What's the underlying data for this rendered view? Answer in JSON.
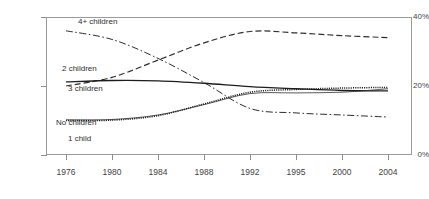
{
  "chart_data": {
    "type": "line",
    "title": "",
    "subtitle": "",
    "xlabel": "",
    "ylabel": "",
    "categories": [
      "1976",
      "1980",
      "1984",
      "1988",
      "1992",
      "1995",
      "2000",
      "2004"
    ],
    "ylim": [
      0,
      40
    ],
    "yticks": [
      0,
      20,
      40
    ],
    "ytick_labels": [
      "0%",
      "20%",
      "40%"
    ],
    "grid": false,
    "legend_position": "inline-annotations",
    "units": "percent",
    "series": [
      {
        "name": "4+ children",
        "line_style": "dash-dot",
        "color": "#2e2e2e",
        "values": [
          36.0,
          33.5,
          28.0,
          21.0,
          13.5,
          12.2,
          11.6,
          11.0
        ]
      },
      {
        "name": "2 children",
        "line_style": "dashed",
        "color": "#2e2e2e",
        "values": [
          20.0,
          22.5,
          27.5,
          32.5,
          35.8,
          35.4,
          34.6,
          34.0
        ]
      },
      {
        "name": "3 children",
        "line_style": "solid-bold",
        "color": "#1d1d1d",
        "values": [
          21.2,
          21.6,
          21.5,
          20.8,
          19.8,
          19.2,
          18.7,
          18.6
        ]
      },
      {
        "name": "No children",
        "line_style": "solid-thin",
        "color": "#2e2e2e",
        "values": [
          10.2,
          10.3,
          11.6,
          14.6,
          17.8,
          18.0,
          18.2,
          19.2
        ]
      },
      {
        "name": "1 child",
        "line_style": "dotted",
        "color": "#1d1d1d",
        "values": [
          10.0,
          10.1,
          11.4,
          14.8,
          18.2,
          19.0,
          19.4,
          19.6
        ]
      }
    ],
    "annotations": [
      {
        "text": "4+ children",
        "series": "4+ children"
      },
      {
        "text": "2 children",
        "series": "2 children"
      },
      {
        "text": "3 children",
        "series": "3 children"
      },
      {
        "text": "No children",
        "series": "No children"
      },
      {
        "text": "1 child",
        "series": "1 child"
      }
    ]
  }
}
